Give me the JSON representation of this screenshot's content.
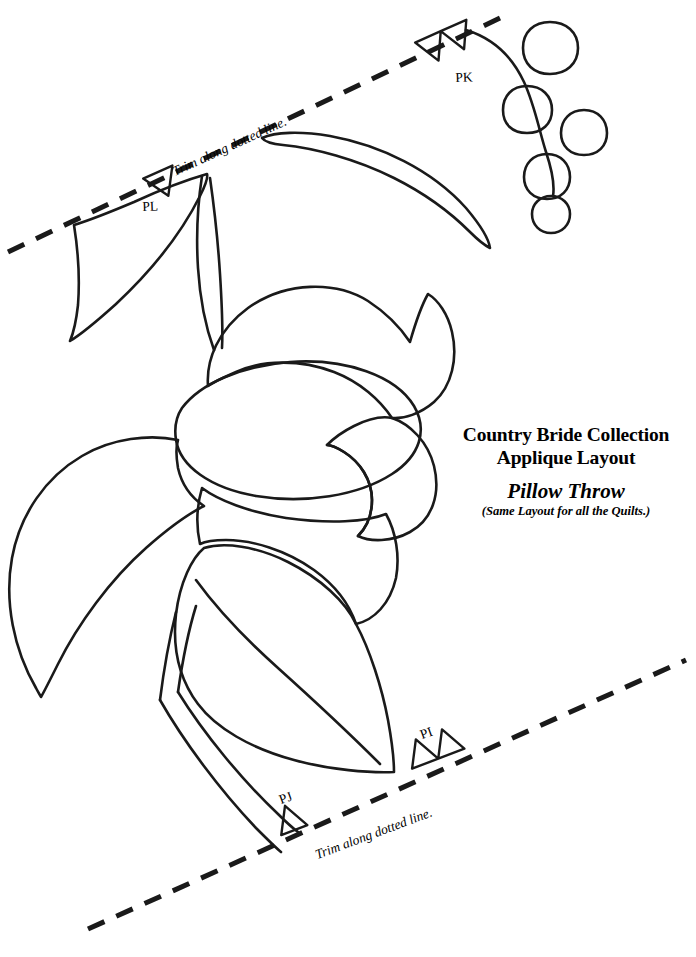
{
  "document": {
    "kind": "applique-pattern-line-drawing",
    "background_color": "#ffffff",
    "ink_color": "#1a1a1a",
    "width": 696,
    "height": 957
  },
  "title_block": {
    "line1": "Country Bride Collection",
    "line2": "Applique Layout",
    "line3": "Pillow Throw",
    "line4": "(Same Layout for all the Quilts.)"
  },
  "trim_lines": [
    {
      "id": "trim-line-top",
      "caption": "Trim along dotted line.",
      "x1": 8,
      "y1": 252,
      "x2": 500,
      "y2": 18,
      "dash": "18 13",
      "width": 5
    },
    {
      "id": "trim-line-bottom",
      "caption": "Trim along dotted line.",
      "x1": 88,
      "y1": 929,
      "x2": 686,
      "y2": 660,
      "dash": "18 13",
      "width": 5
    }
  ],
  "markers": [
    {
      "id": "PL",
      "label": "PL",
      "shape": "single-triangle",
      "x": 160,
      "y": 182,
      "rotation": -24
    },
    {
      "id": "PK",
      "label": "PK",
      "shape": "double-triangle",
      "x": 432,
      "y": 46,
      "rotation": -24
    },
    {
      "id": "PI",
      "label": "PI",
      "shape": "double-triangle",
      "x": 418,
      "y": 745,
      "rotation": -21
    },
    {
      "id": "PJ",
      "label": "PJ",
      "shape": "single-triangle",
      "x": 286,
      "y": 814,
      "rotation": -21
    }
  ],
  "motif": {
    "name": "tulip-with-leaves-and-berries",
    "parts": [
      "berry-cluster",
      "upper-right-leaf",
      "upper-left-leaf",
      "main-stem",
      "flower-petal-top",
      "flower-petal-center",
      "flower-petal-right",
      "flower-petal-lower",
      "left-leaf",
      "lower-leaf",
      "lower-stem"
    ]
  },
  "berries": [
    {
      "cx": 550,
      "cy": 48,
      "r": 26
    },
    {
      "cx": 527,
      "cy": 109,
      "r": 24
    },
    {
      "cx": 584,
      "cy": 132,
      "r": 23
    },
    {
      "cx": 547,
      "cy": 176,
      "r": 23
    },
    {
      "cx": 551,
      "cy": 214,
      "r": 19
    }
  ]
}
